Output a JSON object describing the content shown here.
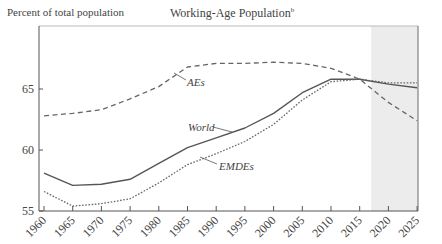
{
  "header": {
    "y_unit_label": "Percent of total population",
    "title": "Working-Age Population",
    "title_superscript": "b"
  },
  "chart_data": {
    "type": "line",
    "title": "Working-Age Population",
    "title_superscript": "b",
    "ylabel": "Percent of total population",
    "xlabel": "",
    "x": [
      1960,
      1965,
      1970,
      1975,
      1980,
      1985,
      1990,
      1995,
      2000,
      2005,
      2010,
      2015,
      2020,
      2025
    ],
    "x_tick_labels": [
      "1960",
      "1965",
      "1970",
      "1975",
      "1980",
      "1985",
      "1990",
      "1995",
      "2000",
      "2005",
      "2010",
      "2015",
      "2020",
      "2025"
    ],
    "y_ticks": [
      55,
      60,
      65
    ],
    "ylim": [
      55,
      70.2
    ],
    "xlim": [
      1959,
      2025.5
    ],
    "grid": false,
    "legend": "inline labels",
    "shaded_region": {
      "from": 2017,
      "to": 2025.5,
      "color": "#ececec",
      "meaning": "projection period"
    },
    "series": [
      {
        "name": "AEs",
        "style": "dashed",
        "color": "#666666",
        "values": [
          62.8,
          63.0,
          63.3,
          64.2,
          65.2,
          66.8,
          67.1,
          67.1,
          67.2,
          67.1,
          66.7,
          65.8,
          63.9,
          62.4
        ]
      },
      {
        "name": "World",
        "style": "solid",
        "color": "#555555",
        "values": [
          58.1,
          57.1,
          57.2,
          57.6,
          58.9,
          60.2,
          61.0,
          61.8,
          63.0,
          64.7,
          65.8,
          65.8,
          65.4,
          65.1
        ]
      },
      {
        "name": "EMDEs",
        "style": "dotted",
        "color": "#666666",
        "values": [
          56.6,
          55.4,
          55.6,
          56.0,
          57.3,
          58.8,
          59.7,
          60.7,
          62.1,
          64.1,
          65.6,
          65.8,
          65.5,
          65.5
        ]
      }
    ]
  }
}
